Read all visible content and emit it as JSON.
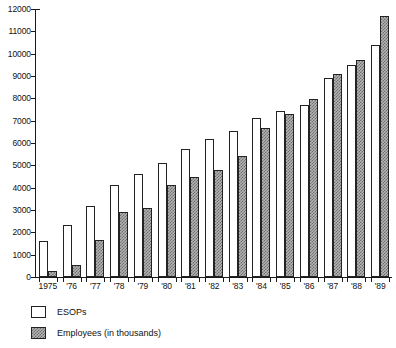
{
  "chart_data": {
    "type": "bar",
    "title": "",
    "subtitle": "",
    "xlabel": "",
    "ylabel": "",
    "ylim": [
      0,
      12000
    ],
    "ytick_step": 1000,
    "grid": false,
    "legend_position": "bottom-left",
    "categories": [
      "1975",
      "'76",
      "'77",
      "'78",
      "'79",
      "'80",
      "'81",
      "'82",
      "'83",
      "'84",
      "'85",
      "'86",
      "'87",
      "'88",
      "'89"
    ],
    "ytick_labels": [
      "12000",
      "11000",
      "10000",
      "9000",
      "8000",
      "7000",
      "6000",
      "5000",
      "4000",
      "3000",
      "2000",
      "1000",
      "0"
    ],
    "ytick_values": [
      12000,
      11000,
      10000,
      9000,
      8000,
      7000,
      6000,
      5000,
      4000,
      3000,
      2000,
      1000,
      0
    ],
    "series": [
      {
        "name": "ESOPs",
        "fill": "white",
        "values": [
          1600,
          2350,
          3200,
          4100,
          4600,
          5100,
          5750,
          6200,
          6550,
          7100,
          7450,
          7700,
          8900,
          9500,
          10400
        ]
      },
      {
        "name": "Employees (in thousands)",
        "fill": "hatched-gray",
        "values": [
          250,
          550,
          1650,
          2900,
          3100,
          4100,
          4500,
          4800,
          5400,
          6650,
          7300,
          7950,
          9100,
          9700,
          11700
        ]
      }
    ]
  },
  "legend": {
    "items": [
      {
        "label": "ESOPs",
        "swatch": "white-square-icon"
      },
      {
        "label": "Employees (in thousands)",
        "swatch": "hatched-square-icon"
      }
    ]
  },
  "colors": {
    "axis": "#1a1a1a",
    "bar_outline": "#232323",
    "esops_fill": "#ffffff",
    "employees_fill": "#b4b4b4",
    "employees_hatch": "#6e6e6e",
    "background": "#ffffff",
    "text": "#111111"
  }
}
